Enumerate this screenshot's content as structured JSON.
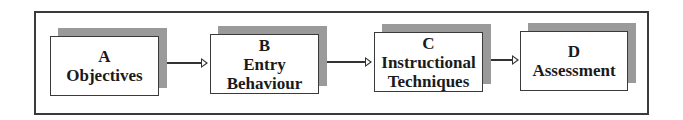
{
  "diagram": {
    "type": "flowchart",
    "direction": "left-to-right",
    "nodes": [
      {
        "id": "A",
        "letter": "A",
        "label_lines": [
          "Objectives"
        ]
      },
      {
        "id": "B",
        "letter": "B",
        "label_lines": [
          "Entry",
          "Behaviour"
        ]
      },
      {
        "id": "C",
        "letter": "C",
        "label_lines": [
          "Instructional",
          "Techniques"
        ]
      },
      {
        "id": "D",
        "letter": "D",
        "label_lines": [
          "Assessment"
        ]
      }
    ],
    "edges": [
      {
        "from": "A",
        "to": "B"
      },
      {
        "from": "B",
        "to": "C"
      },
      {
        "from": "C",
        "to": "D"
      }
    ],
    "colors": {
      "frame_border": "#3a3a3a",
      "box_fill": "#ffffff",
      "box_shadow": "#9a9a9a",
      "text": "#1a1a1a",
      "arrow": "#333333"
    }
  }
}
